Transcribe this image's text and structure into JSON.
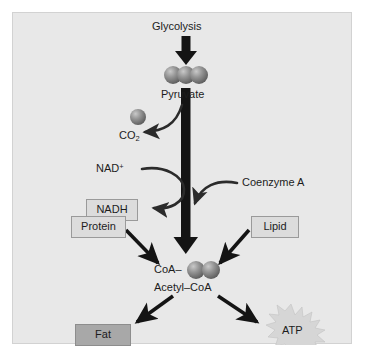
{
  "figure": {
    "panel_bg": "#e8e8e8",
    "sphere_color": "#8c8c8c",
    "arrow_color": "#141414",
    "box_fill": "#dcdcdc",
    "box_fill_dark": "#a8a8a8",
    "burst_fill": "#d8d8d8"
  },
  "nodes": {
    "glycolysis": {
      "label": "Glycolysis"
    },
    "pyruvate": {
      "label": "Pyruvate",
      "sphere_count": 3
    },
    "co2": {
      "label": "CO",
      "subscript": "2"
    },
    "nad_plus": {
      "label": "NAD",
      "superscript": "+"
    },
    "nadh": {
      "label": "NADH"
    },
    "coenzyme_a": {
      "label": "Coenzyme A"
    },
    "protein": {
      "label": "Protein"
    },
    "lipid": {
      "label": "Lipid"
    },
    "coa": {
      "label": "CoA–",
      "sphere_count": 2
    },
    "acetyl_coa": {
      "label": "Acetyl–CoA"
    },
    "fat": {
      "label": "Fat"
    },
    "atp": {
      "label": "ATP"
    }
  },
  "edges": [
    {
      "name": "glycolysis-to-pyruvate",
      "type": "thick-straight-down"
    },
    {
      "name": "pyruvate-to-acetyl-coa",
      "type": "thick-straight-down"
    },
    {
      "name": "release-co2",
      "type": "curved"
    },
    {
      "name": "nad-plus-to-nadh",
      "type": "curved"
    },
    {
      "name": "coenzyme-a-in",
      "type": "curved"
    },
    {
      "name": "protein-to-acetyl-coa",
      "type": "straight"
    },
    {
      "name": "lipid-to-acetyl-coa",
      "type": "straight"
    },
    {
      "name": "acetyl-coa-to-fat",
      "type": "straight"
    },
    {
      "name": "acetyl-coa-to-atp",
      "type": "straight"
    }
  ]
}
